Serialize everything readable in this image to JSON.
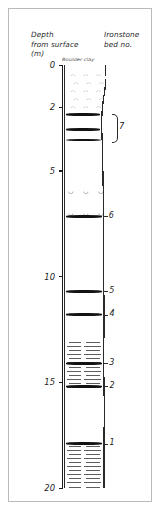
{
  "figure": {
    "kind": "borehole-log",
    "depth_header": "Depth\nfrom surface\n(m)",
    "bed_header": "Ironstone\nbed no.",
    "top_annotation": "Boulder clay",
    "axis": {
      "unit": "m",
      "min": 0,
      "max": 20,
      "labels": [
        "0",
        "2",
        "5",
        "10",
        "15",
        "20"
      ],
      "label_depths": [
        0,
        2,
        5,
        10,
        15,
        20
      ]
    },
    "bracket": {
      "label": "7",
      "from_depth": 2.3,
      "to_depth": 3.6
    },
    "beds": [
      {
        "no": "7a",
        "depth": 2.35,
        "label": ""
      },
      {
        "no": "7b",
        "depth": 3.05,
        "label": ""
      },
      {
        "no": "7c",
        "depth": 3.55,
        "label": ""
      },
      {
        "no": "6",
        "depth": 7.15,
        "label": "6"
      },
      {
        "no": "5",
        "depth": 10.7,
        "label": "5"
      },
      {
        "no": "4",
        "depth": 11.8,
        "label": "4"
      },
      {
        "no": "3",
        "depth": 14.1,
        "label": "3"
      },
      {
        "no": "2",
        "depth": 15.2,
        "label": "2"
      },
      {
        "no": "1",
        "depth": 17.9,
        "label": "1"
      }
    ],
    "lithologies": [
      {
        "name": "boulder-clay",
        "from": 0.0,
        "to": 2.3,
        "pattern": "clasts"
      },
      {
        "name": "mudstone",
        "from": 2.3,
        "to": 5.6,
        "pattern": "blank"
      },
      {
        "name": "shelly-bed",
        "from": 5.6,
        "to": 6.1,
        "pattern": "shells"
      },
      {
        "name": "mudstone",
        "from": 6.1,
        "to": 6.6,
        "pattern": "blank"
      },
      {
        "name": "shelly-bed",
        "from": 6.6,
        "to": 7.2,
        "pattern": "shells"
      },
      {
        "name": "mudstone",
        "from": 7.2,
        "to": 13.0,
        "pattern": "blank"
      },
      {
        "name": "shale",
        "from": 13.0,
        "to": 15.4,
        "pattern": "lines"
      },
      {
        "name": "mudstone",
        "from": 15.4,
        "to": 17.9,
        "pattern": "blank"
      },
      {
        "name": "shale",
        "from": 17.9,
        "to": 20.0,
        "pattern": "lines"
      }
    ],
    "colors": {
      "ink": "#1c1c1c",
      "iron": "#121212",
      "hatch": "#5d5d5d",
      "frame": "#b9b9b9"
    }
  }
}
